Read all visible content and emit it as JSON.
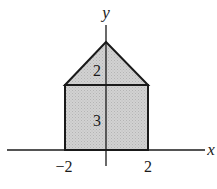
{
  "figure": {
    "axes": {
      "x_label": "x",
      "y_label": "y",
      "x_ticks": [
        {
          "value": -2,
          "label": "−2"
        },
        {
          "value": 2,
          "label": "2"
        }
      ]
    },
    "regions": [
      {
        "name": "triangle",
        "label": "2",
        "description": "height of triangle"
      },
      {
        "name": "rectangle",
        "label": "3",
        "description": "height of rectangle"
      }
    ],
    "colors": {
      "fill": "#c8c8c8",
      "stroke": "#1a1a1a"
    }
  }
}
